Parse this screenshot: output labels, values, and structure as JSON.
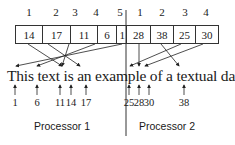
{
  "processors": [
    {
      "label": "Processor 1",
      "positions": [
        "1",
        "2",
        "3",
        "4",
        "5"
      ],
      "values": [
        "14",
        "17",
        "11",
        "6",
        "1"
      ],
      "offsets": [
        "1",
        "6",
        "11",
        "14",
        "17"
      ]
    },
    {
      "label": "Processor 2",
      "positions": [
        "1",
        "2",
        "3",
        "4"
      ],
      "values": [
        "28",
        "38",
        "25",
        "30"
      ],
      "offsets": [
        "25",
        "28",
        "30",
        "38"
      ]
    }
  ],
  "sentence": "This text is an example of a textual database"
}
